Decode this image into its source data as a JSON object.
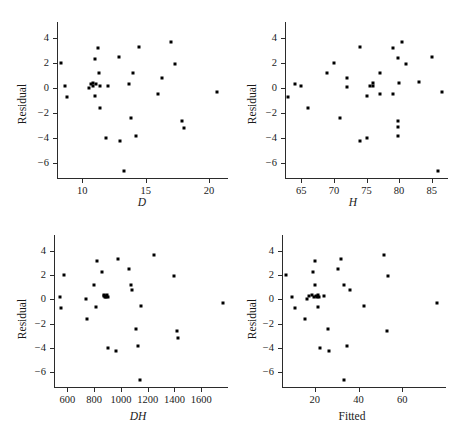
{
  "figure": {
    "title": "",
    "ylabel": "Residual",
    "panels": [
      {
        "id": "panel-d",
        "xlabel": "D",
        "xlabel_italic": true,
        "xticks": [
          10,
          15,
          20
        ],
        "xticklabels": [
          "10",
          "15",
          "20"
        ],
        "xlim": [
          8,
          21.5
        ],
        "yticks": [
          4,
          2,
          0,
          -2,
          -4,
          -6
        ],
        "yticklabels": [
          "4",
          "2",
          "0",
          "−2",
          "−4",
          "−6"
        ],
        "ylim": [
          -7.2,
          5.3
        ]
      },
      {
        "id": "panel-h",
        "xlabel": "H",
        "xlabel_italic": true,
        "xticks": [
          65,
          70,
          75,
          80,
          85
        ],
        "xticklabels": [
          "65",
          "70",
          "75",
          "80",
          "85"
        ],
        "xlim": [
          62.5,
          87.5
        ],
        "yticks": [
          4,
          2,
          0,
          -2,
          -4,
          -6
        ],
        "yticklabels": [
          "4",
          "2",
          "0",
          "−2",
          "−4",
          "−6"
        ],
        "ylim": [
          -7.2,
          5.3
        ]
      },
      {
        "id": "panel-dh",
        "xlabel": "DH",
        "xlabel_italic": true,
        "xticks": [
          600,
          800,
          1000,
          1200,
          1400,
          1600
        ],
        "xticklabels": [
          "600",
          "800",
          "1000",
          "1200",
          "1400",
          "1600"
        ],
        "xlim": [
          500,
          1800
        ],
        "yticks": [
          4,
          2,
          0,
          -2,
          -4,
          -6
        ],
        "yticklabels": [
          "4",
          "2",
          "0",
          "−2",
          "−4",
          "−6"
        ],
        "ylim": [
          -7.2,
          5.3
        ]
      },
      {
        "id": "panel-fitted",
        "xlabel": "Fitted",
        "xlabel_italic": false,
        "xticks": [
          20,
          40,
          60
        ],
        "xticklabels": [
          "20",
          "40",
          "60"
        ],
        "xlim": [
          5,
          80
        ],
        "yticks": [
          4,
          2,
          0,
          -2,
          -4,
          -6
        ],
        "yticklabels": [
          "4",
          "2",
          "0",
          "−2",
          "−4",
          "−6"
        ],
        "ylim": [
          -7.2,
          5.3
        ]
      }
    ]
  },
  "chart_data": [
    {
      "type": "scatter",
      "title": "",
      "xlabel": "D",
      "ylabel": "Residual",
      "xlim": [
        8,
        21.5
      ],
      "ylim": [
        -7.2,
        5.3
      ],
      "grid": false,
      "legend": "none",
      "x": [
        8.3,
        8.6,
        8.8,
        10.5,
        10.7,
        10.8,
        10.8,
        11.0,
        11.0,
        11.1,
        11.2,
        11.3,
        11.4,
        11.4,
        11.9,
        12.0,
        12.9,
        13.0,
        13.3,
        13.7,
        13.8,
        14.0,
        14.2,
        14.5,
        16.0,
        16.3,
        17.0,
        17.3,
        17.9,
        18.0,
        20.6
      ],
      "y": [
        2.0,
        0.2,
        -0.7,
        0.0,
        0.3,
        0.4,
        0.2,
        2.3,
        -0.6,
        0.3,
        3.2,
        1.2,
        0.2,
        -1.6,
        -4.0,
        0.2,
        2.5,
        -4.2,
        -6.6,
        0.3,
        -2.4,
        1.2,
        -3.8,
        3.3,
        -0.5,
        0.8,
        3.7,
        1.9,
        -2.6,
        -3.2,
        -0.3
      ]
    },
    {
      "type": "scatter",
      "title": "",
      "xlabel": "H",
      "ylabel": "Residual",
      "xlim": [
        62.5,
        87.5
      ],
      "ylim": [
        -7.2,
        5.3
      ],
      "grid": false,
      "legend": "none",
      "x": [
        63.0,
        64.0,
        65.0,
        66.0,
        69.0,
        70.0,
        71.0,
        72.0,
        72.0,
        74.0,
        74.0,
        75.0,
        75.0,
        75.5,
        76.0,
        76.0,
        77.0,
        77.0,
        79.0,
        79.0,
        79.8,
        79.8,
        79.9,
        79.9,
        80.0,
        80.5,
        81.0,
        83.0,
        85.0,
        86.0,
        86.5
      ],
      "y": [
        -0.7,
        0.3,
        0.2,
        -1.6,
        1.2,
        2.0,
        -2.4,
        0.8,
        0.1,
        3.3,
        -4.2,
        -0.6,
        -4.0,
        0.2,
        0.2,
        0.4,
        -0.5,
        1.2,
        3.2,
        -0.5,
        2.4,
        -2.6,
        -3.1,
        -3.8,
        0.4,
        3.7,
        1.9,
        0.5,
        2.5,
        -6.6,
        -0.3
      ]
    },
    {
      "type": "scatter",
      "title": "",
      "xlabel": "DH",
      "ylabel": "Residual",
      "xlim": [
        500,
        1800
      ],
      "ylim": [
        -7.2,
        5.3
      ],
      "grid": false,
      "legend": "none",
      "x": [
        545,
        550,
        575,
        735,
        745,
        800,
        815,
        820,
        860,
        870,
        875,
        880,
        885,
        890,
        895,
        900,
        905,
        960,
        975,
        1060,
        1075,
        1085,
        1110,
        1130,
        1140,
        1150,
        1250,
        1395,
        1420,
        1425,
        1760
      ],
      "y": [
        0.2,
        -0.7,
        2.0,
        0.0,
        -1.6,
        1.2,
        -0.6,
        3.2,
        2.3,
        0.3,
        0.4,
        0.2,
        0.3,
        0.2,
        0.4,
        -4.0,
        0.2,
        -4.2,
        3.3,
        2.5,
        1.2,
        0.8,
        -2.4,
        -3.8,
        -6.6,
        -0.5,
        3.7,
        1.9,
        -2.6,
        -3.2,
        -0.3
      ]
    },
    {
      "type": "scatter",
      "title": "",
      "xlabel": "Fitted",
      "ylabel": "Residual",
      "xlim": [
        5,
        80
      ],
      "ylim": [
        -7.2,
        5.3
      ],
      "grid": false,
      "legend": "none",
      "x": [
        7.0,
        9.5,
        11.0,
        15.5,
        16.5,
        17.5,
        18.5,
        19.0,
        19.5,
        20.0,
        20.0,
        20.5,
        21.0,
        21.5,
        21.5,
        22.0,
        22.5,
        24.0,
        26.0,
        26.5,
        30.5,
        32.0,
        33.5,
        33.5,
        34.5,
        36.0,
        42.5,
        51.5,
        53.0,
        53.5,
        76.0
      ],
      "y": [
        2.0,
        0.2,
        -0.7,
        -1.6,
        0.0,
        0.3,
        0.4,
        2.3,
        0.2,
        3.2,
        1.2,
        0.3,
        0.2,
        0.4,
        -0.6,
        0.2,
        -4.0,
        0.3,
        -2.4,
        -4.2,
        2.5,
        3.3,
        -6.6,
        1.2,
        -3.8,
        0.8,
        -0.5,
        3.7,
        -2.6,
        1.9,
        -0.3
      ]
    }
  ]
}
